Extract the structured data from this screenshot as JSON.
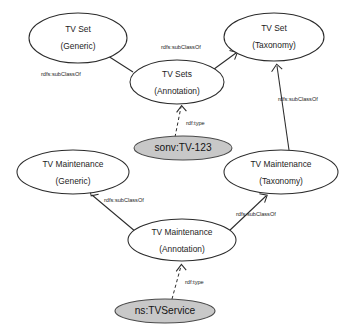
{
  "diagram": {
    "type": "rdf-class-hierarchy-graph",
    "background_color": "#ffffff",
    "class_node_fill": "#ffffff",
    "instance_node_fill": "#c8c8c8",
    "stroke_color": "#2b2b2b",
    "nodes": [
      {
        "id": "tv-set-generic",
        "kind": "class",
        "shaded": false,
        "line1": "TV Set",
        "line2": "(Generic)",
        "cx": 78,
        "cy": 38,
        "rx": 49,
        "ry": 25
      },
      {
        "id": "tv-set-taxonomy",
        "kind": "class",
        "shaded": false,
        "line1": "TV Set",
        "line2": "(Taxonomy)",
        "cx": 274,
        "cy": 37,
        "rx": 50,
        "ry": 24
      },
      {
        "id": "tv-sets-annotation",
        "kind": "class",
        "shaded": false,
        "line1": "TV Sets",
        "line2": "(Annotation)",
        "cx": 177,
        "cy": 82,
        "rx": 47,
        "ry": 22
      },
      {
        "id": "sonv-tv-123",
        "kind": "instance",
        "shaded": true,
        "line1": "sonv:TV-123",
        "line2": "",
        "cx": 183,
        "cy": 148,
        "rx": 49,
        "ry": 12
      },
      {
        "id": "tv-maintenance-generic",
        "kind": "class",
        "shaded": false,
        "line1": "TV Maintenance",
        "line2": "(Generic)",
        "cx": 73,
        "cy": 172,
        "rx": 56,
        "ry": 22
      },
      {
        "id": "tv-maintenance-taxonomy",
        "kind": "class",
        "shaded": false,
        "line1": "TV Maintenance",
        "line2": "(Taxonomy)",
        "cx": 281,
        "cy": 172,
        "rx": 57,
        "ry": 22
      },
      {
        "id": "tv-maintenance-annotation",
        "kind": "class",
        "shaded": false,
        "line1": "TV Maintenance",
        "line2": "(Annotation)",
        "cx": 182,
        "cy": 240,
        "rx": 54,
        "ry": 21
      },
      {
        "id": "ns-tvservice",
        "kind": "instance",
        "shaded": true,
        "line1": "ns:TVService",
        "line2": "",
        "cx": 165,
        "cy": 311,
        "rx": 50,
        "ry": 12
      }
    ],
    "edges": [
      {
        "id": "e1",
        "from": "tv-sets-annotation",
        "to": "tv-set-generic",
        "label": "rdfs:subClassOf",
        "style": "solid",
        "x1": 133,
        "y1": 72,
        "x2": 106,
        "y2": 55,
        "label_x": 41,
        "label_y": 75
      },
      {
        "id": "e2",
        "from": "tv-sets-annotation",
        "to": "tv-set-taxonomy",
        "label": "rdfs:subClassOf",
        "style": "solid",
        "x1": 210,
        "y1": 72,
        "x2": 238,
        "y2": 52,
        "label_x": 161,
        "label_y": 48
      },
      {
        "id": "e3",
        "from": "sonv-tv-123",
        "to": "tv-sets-annotation",
        "label": "rdf:type",
        "style": "dashed",
        "x1": 176,
        "y1": 136,
        "x2": 181,
        "y2": 104,
        "label_x": 186,
        "label_y": 124
      },
      {
        "id": "e4",
        "from": "tv-maintenance-taxonomy",
        "to": "tv-set-taxonomy",
        "label": "rdfs:subClassOf",
        "style": "solid",
        "x1": 288,
        "y1": 150,
        "x2": 277,
        "y2": 62,
        "label_x": 278,
        "label_y": 100
      },
      {
        "id": "e5",
        "from": "tv-maintenance-annotation",
        "to": "tv-maintenance-generic",
        "label": "rdfs:subClassOf",
        "style": "solid",
        "x1": 135,
        "y1": 232,
        "x2": 90,
        "y2": 194,
        "label_x": 104,
        "label_y": 201
      },
      {
        "id": "e6",
        "from": "tv-maintenance-annotation",
        "to": "tv-maintenance-taxonomy",
        "label": "rdfs:subClassOf",
        "style": "solid",
        "x1": 229,
        "y1": 232,
        "x2": 264,
        "y2": 194,
        "label_x": 236,
        "label_y": 215
      },
      {
        "id": "e7",
        "from": "ns-tvservice",
        "to": "tv-maintenance-annotation",
        "label": "rdf:type",
        "style": "dashed",
        "x1": 173,
        "y1": 299,
        "x2": 181,
        "y2": 262,
        "label_x": 185,
        "label_y": 283
      }
    ],
    "labels": {
      "sub_class_of": "rdfs:subClassOf",
      "rdf_type": "rdf:type"
    }
  }
}
